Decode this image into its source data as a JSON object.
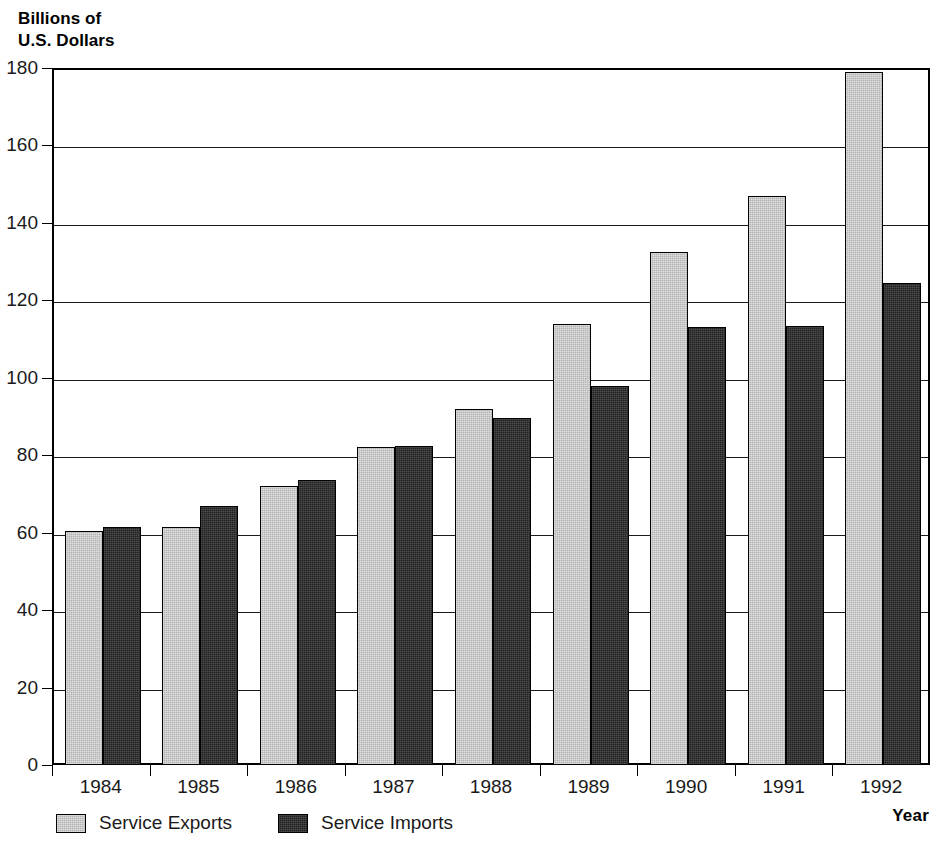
{
  "chart_data": {
    "type": "bar",
    "title": "",
    "subtitle": "",
    "ylabel": "Billions of\nU.S. Dollars",
    "xlabel": "Year",
    "categories": [
      "1984",
      "1985",
      "1986",
      "1987",
      "1988",
      "1989",
      "1990",
      "1991",
      "1992"
    ],
    "series": [
      {
        "name": "Service Exports",
        "color": "#b3b3b3",
        "values": [
          60.5,
          61.5,
          72.0,
          82.0,
          92.0,
          114.0,
          132.5,
          147.0,
          179.0
        ]
      },
      {
        "name": "Service Imports",
        "color": "#232323",
        "values": [
          61.5,
          67.0,
          73.5,
          82.5,
          89.5,
          98.0,
          113.0,
          113.5,
          124.5
        ]
      }
    ],
    "ylim": [
      0,
      180
    ],
    "ytick_step": 20,
    "yticks": [
      "0",
      "20",
      "40",
      "60",
      "80",
      "100",
      "120",
      "140",
      "160",
      "180"
    ],
    "grid": "horizontal",
    "legend_position": "bottom-left",
    "units": "Billions of U.S. Dollars"
  },
  "axes": {
    "y_title_line1": "Billions of",
    "y_title_line2": "U.S. Dollars",
    "x_title": "Year"
  },
  "legend": {
    "items": [
      {
        "label": "Service Exports",
        "color": "#b3b3b3"
      },
      {
        "label": "Service Imports",
        "color": "#232323"
      }
    ]
  }
}
